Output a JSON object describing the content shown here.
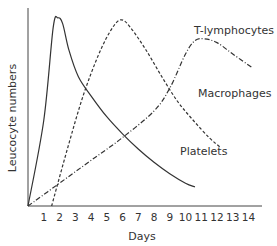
{
  "chart_data": {
    "type": "line",
    "title": "",
    "xlabel": "Days",
    "ylabel": "Leucocyte numbers",
    "xlim": [
      0,
      14.7
    ],
    "ylim": [
      0,
      100
    ],
    "x_ticks": [
      1,
      2,
      3,
      4,
      5,
      6,
      7,
      8,
      9,
      10,
      11,
      12,
      13,
      14
    ],
    "series": [
      {
        "name": "Platelets",
        "style": "solid",
        "points": [
          [
            0,
            0
          ],
          [
            1,
            45
          ],
          [
            1.6,
            94
          ],
          [
            1.9,
            99
          ],
          [
            2.2,
            96
          ],
          [
            2.6,
            82
          ],
          [
            3.2,
            68
          ],
          [
            4,
            58
          ],
          [
            5,
            47
          ],
          [
            6,
            38
          ],
          [
            7,
            30
          ],
          [
            8,
            23
          ],
          [
            9,
            17
          ],
          [
            10,
            12
          ],
          [
            10.6,
            10
          ]
        ]
      },
      {
        "name": "Macrophages",
        "style": "dashed",
        "points": [
          [
            1.5,
            0
          ],
          [
            2.5,
            30
          ],
          [
            3.5,
            58
          ],
          [
            4.5,
            80
          ],
          [
            5.3,
            93
          ],
          [
            5.9,
            98
          ],
          [
            6.5,
            94
          ],
          [
            7.5,
            82
          ],
          [
            8.5,
            68
          ],
          [
            9.5,
            55
          ],
          [
            10.5,
            45
          ],
          [
            11.5,
            36
          ],
          [
            12.2,
            31
          ]
        ]
      },
      {
        "name": "T-lymphocytes",
        "style": "dash-dot",
        "points": [
          [
            0,
            0
          ],
          [
            2,
            12
          ],
          [
            4,
            24
          ],
          [
            6,
            36
          ],
          [
            8,
            50
          ],
          [
            9,
            62
          ],
          [
            10,
            80
          ],
          [
            10.6,
            87
          ],
          [
            11.2,
            88
          ],
          [
            12,
            86
          ],
          [
            13,
            80
          ],
          [
            14.2,
            73
          ]
        ]
      }
    ],
    "annotations": [
      {
        "text": "T-lymphocytes",
        "near_series": "T-lymphocytes"
      },
      {
        "text": "Macrophages",
        "near_series": "Macrophages"
      },
      {
        "text": "Platelets",
        "near_series": "Platelets"
      }
    ],
    "grid": false,
    "legend": "none (inline labels)"
  }
}
